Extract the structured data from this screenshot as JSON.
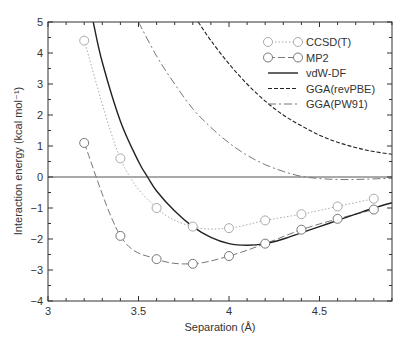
{
  "chart_data": {
    "type": "line",
    "title": "",
    "xlabel": "Separation (Å)",
    "ylabel": "Interaction energy (kcal mol⁻¹)",
    "xlim": [
      3.0,
      4.92
    ],
    "ylim": [
      -4,
      5
    ],
    "xticks": [
      3,
      3.5,
      4,
      4.5
    ],
    "xtick_labels": [
      "3",
      "3.5",
      "4",
      "4.5"
    ],
    "yticks": [
      -4,
      -3,
      -2,
      -1,
      0,
      1,
      2,
      3,
      4,
      5
    ],
    "ytick_labels": [
      "−4",
      "−3",
      "−2",
      "−1",
      "0",
      "1",
      "2",
      "3",
      "4",
      "5"
    ],
    "grid": false,
    "legend_position": "upper right",
    "series": [
      {
        "name": "CCSD(T)",
        "style": "dotted-circle-markers",
        "color": "#aaaaaa",
        "x": [
          3.2,
          3.4,
          3.6,
          3.8,
          4.0,
          4.2,
          4.4,
          4.6,
          4.8
        ],
        "y": [
          4.4,
          0.6,
          -1.0,
          -1.6,
          -1.65,
          -1.4,
          -1.2,
          -0.95,
          -0.7
        ]
      },
      {
        "name": "MP2",
        "style": "dashed-circle-markers",
        "color": "#777777",
        "x": [
          3.2,
          3.4,
          3.6,
          3.8,
          4.0,
          4.2,
          4.4,
          4.6,
          4.8
        ],
        "y": [
          1.1,
          -1.9,
          -2.65,
          -2.8,
          -2.55,
          -2.15,
          -1.7,
          -1.35,
          -1.05
        ]
      },
      {
        "name": "vdW-DF",
        "style": "solid",
        "color": "#222222",
        "x": [
          3.25,
          3.3,
          3.4,
          3.5,
          3.55,
          3.6,
          3.7,
          3.8,
          3.9,
          4.0,
          4.1,
          4.2,
          4.3,
          4.4,
          4.5,
          4.6,
          4.7,
          4.8,
          4.92
        ],
        "y": [
          5.0,
          3.7,
          1.8,
          0.5,
          0.0,
          -0.45,
          -1.1,
          -1.6,
          -1.95,
          -2.15,
          -2.2,
          -2.15,
          -2.0,
          -1.8,
          -1.6,
          -1.4,
          -1.2,
          -1.0,
          -0.8
        ]
      },
      {
        "name": "GGA(revPBE)",
        "style": "dashed",
        "color": "#222222",
        "x": [
          3.83,
          3.9,
          4.0,
          4.1,
          4.2,
          4.3,
          4.4,
          4.5,
          4.6,
          4.7,
          4.8,
          4.92
        ],
        "y": [
          5.0,
          4.4,
          3.65,
          3.0,
          2.45,
          2.0,
          1.65,
          1.35,
          1.12,
          0.95,
          0.82,
          0.72
        ]
      },
      {
        "name": "GGA(PW91)",
        "style": "dash-dot",
        "color": "#777777",
        "x": [
          3.5,
          3.6,
          3.7,
          3.8,
          3.9,
          4.0,
          4.1,
          4.2,
          4.3,
          4.4,
          4.5,
          4.6,
          4.7,
          4.8,
          4.92
        ],
        "y": [
          5.0,
          3.9,
          3.0,
          2.2,
          1.6,
          1.1,
          0.7,
          0.4,
          0.18,
          0.02,
          -0.05,
          -0.08,
          -0.08,
          -0.06,
          -0.04
        ]
      }
    ]
  },
  "legend": {
    "items": [
      "CCSD(T)",
      "MP2",
      "vdW-DF",
      "GGA(revPBE)",
      "GGA(PW91)"
    ]
  }
}
